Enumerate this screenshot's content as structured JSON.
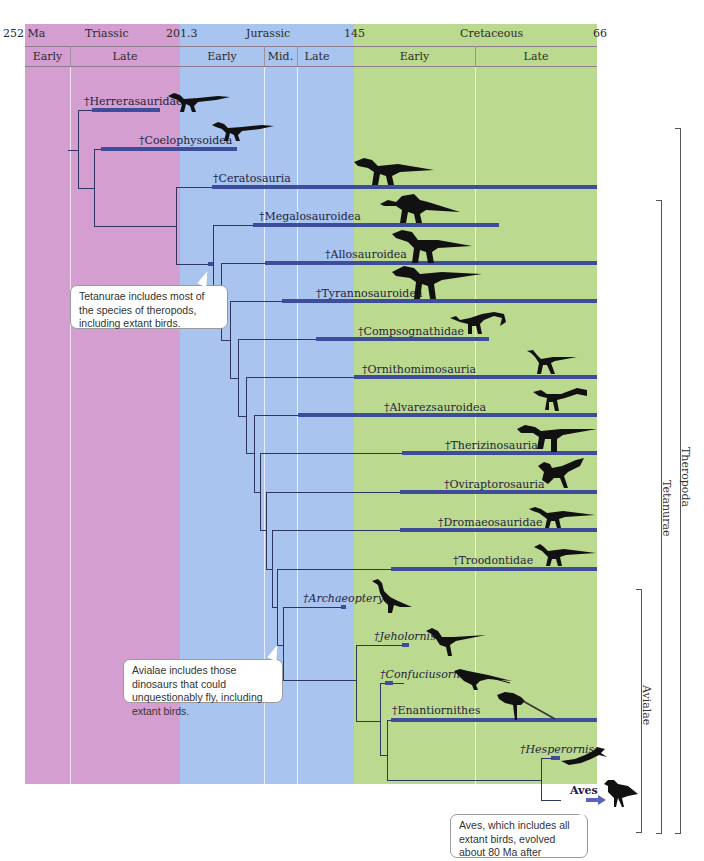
{
  "timescale": {
    "unit_label": "252 Ma",
    "boundaries": [
      "252 Ma",
      "201.3",
      "145",
      "66"
    ],
    "periods": [
      {
        "name": "Triassic",
        "color": "#d49fd0",
        "subdivisions": [
          "Early",
          "Late"
        ]
      },
      {
        "name": "Jurassic",
        "color": "#a9c4ef",
        "subdivisions": [
          "Early",
          "Mid.",
          "Late"
        ]
      },
      {
        "name": "Cretaceous",
        "color": "#bcda8f",
        "subdivisions": [
          "Early",
          "Late"
        ]
      }
    ]
  },
  "taxa": [
    {
      "name": "†Herrerasauridae",
      "italic": false,
      "silhouette": "theropod-icon"
    },
    {
      "name": "†Coelophysoidea",
      "italic": false,
      "silhouette": "theropod-icon"
    },
    {
      "name": "†Ceratosauria",
      "italic": false,
      "silhouette": "theropod-icon"
    },
    {
      "name": "†Megalosauroidea",
      "italic": false,
      "silhouette": "spinosaur-icon"
    },
    {
      "name": "†Allosauroidea",
      "italic": false,
      "silhouette": "theropod-icon"
    },
    {
      "name": "†Tyrannosauroidea",
      "italic": false,
      "silhouette": "theropod-icon"
    },
    {
      "name": "†Compsognathidae",
      "italic": false,
      "silhouette": "small-theropod-icon"
    },
    {
      "name": "†Ornithomimosauria",
      "italic": false,
      "silhouette": "ostrich-dino-icon"
    },
    {
      "name": "†Alvarezsauroidea",
      "italic": false,
      "silhouette": "small-theropod-icon"
    },
    {
      "name": "†Therizinosauria",
      "italic": false,
      "silhouette": "theropod-icon"
    },
    {
      "name": "†Oviraptorosauria",
      "italic": false,
      "silhouette": "feathered-dino-icon"
    },
    {
      "name": "†Dromaeosauridae",
      "italic": false,
      "silhouette": "raptor-icon"
    },
    {
      "name": "†Troodontidae",
      "italic": false,
      "silhouette": "raptor-icon"
    },
    {
      "name": "†Archaeopteryx",
      "italic": true,
      "silhouette": "early-bird-icon"
    },
    {
      "name": "†Jeholornis",
      "italic": true,
      "silhouette": "early-bird-icon"
    },
    {
      "name": "†Confuciusornis",
      "italic": true,
      "silhouette": "bird-icon"
    },
    {
      "name": "†Enantiornithes",
      "italic": false,
      "silhouette": "bird-icon"
    },
    {
      "name": "†Hesperornis",
      "italic": true,
      "silhouette": "diving-bird-icon"
    },
    {
      "name": "Aves",
      "italic": false,
      "silhouette": "bird-icon"
    }
  ],
  "callouts": {
    "tetanurae": "Tetanurae includes most of the species of theropods, including extant birds.",
    "avialae": "Avialae includes those dinosaurs that could unquestionably fly, including extant birds.",
    "aves": "Aves, which includes all extant birds, evolved about 80 Ma after †Archaeopteryx."
  },
  "brackets": [
    {
      "label": "Theropoda"
    },
    {
      "label": "Tetanurae"
    },
    {
      "label": "Avialae"
    }
  ],
  "colors": {
    "triassic": "#d49fd0",
    "jurassic": "#a9c4ef",
    "cretaceous": "#bcda8f",
    "range_bar": "#3e4c9c",
    "branch": "#2f3560"
  }
}
